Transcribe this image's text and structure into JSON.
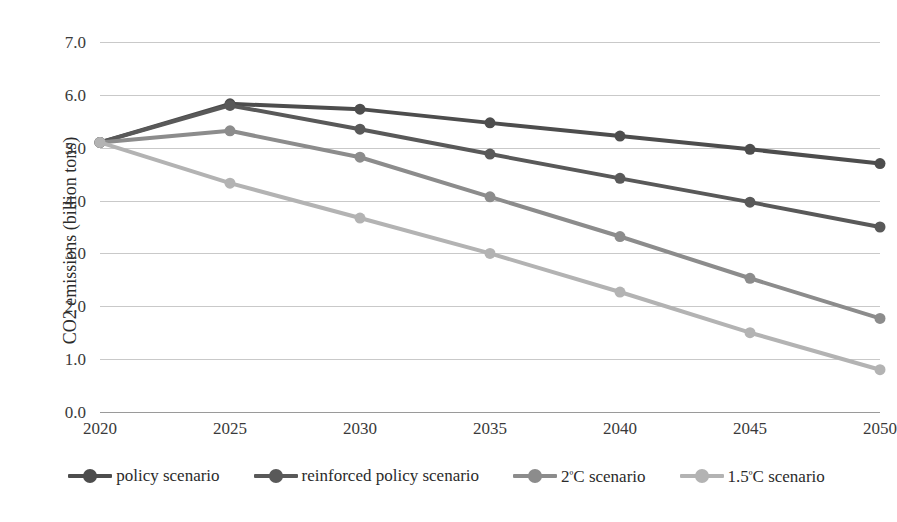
{
  "chart_data": {
    "type": "line",
    "title": "",
    "xlabel": "",
    "ylabel": "CO2 emissions (billion tons)",
    "categories": [
      "2020",
      "2025",
      "2030",
      "2035",
      "2040",
      "2045",
      "2050"
    ],
    "x": [
      2020,
      2025,
      2030,
      2035,
      2040,
      2045,
      2050
    ],
    "ylim": [
      0.0,
      7.0
    ],
    "ytick_labels": [
      "0.0",
      "1.0",
      "2.0",
      "3.0",
      "4.0",
      "5.0",
      "6.0",
      "7.0"
    ],
    "ytick_values": [
      0.0,
      1.0,
      2.0,
      3.0,
      4.0,
      5.0,
      6.0,
      7.0
    ],
    "grid": true,
    "legend_position": "bottom",
    "series": [
      {
        "name": "policy scenario",
        "color": "#4d4d4d",
        "values": [
          5.1,
          5.83,
          5.73,
          5.47,
          5.22,
          4.97,
          4.7
        ]
      },
      {
        "name": "reinforced policy scenario",
        "color": "#595959",
        "values": [
          5.1,
          5.8,
          5.35,
          4.88,
          4.42,
          3.97,
          3.5
        ]
      },
      {
        "name": "2ºC scenario",
        "color": "#8c8c8c",
        "values": [
          5.1,
          5.32,
          4.82,
          4.07,
          3.32,
          2.53,
          1.77
        ]
      },
      {
        "name": "1.5ºC scenario",
        "color": "#b3b3b3",
        "values": [
          5.1,
          4.33,
          3.67,
          3.0,
          2.27,
          1.5,
          0.8
        ]
      }
    ]
  },
  "legend": {
    "items": [
      {
        "label": "policy scenario",
        "color": "#4d4d4d"
      },
      {
        "label": "reinforced policy scenario",
        "color": "#595959"
      },
      {
        "label": "2ºC scenario",
        "color": "#8c8c8c"
      },
      {
        "label": "1.5ºC scenario",
        "color": "#b3b3b3"
      }
    ]
  },
  "axes": {
    "y_title": "CO2 emissions (billion tons)"
  }
}
